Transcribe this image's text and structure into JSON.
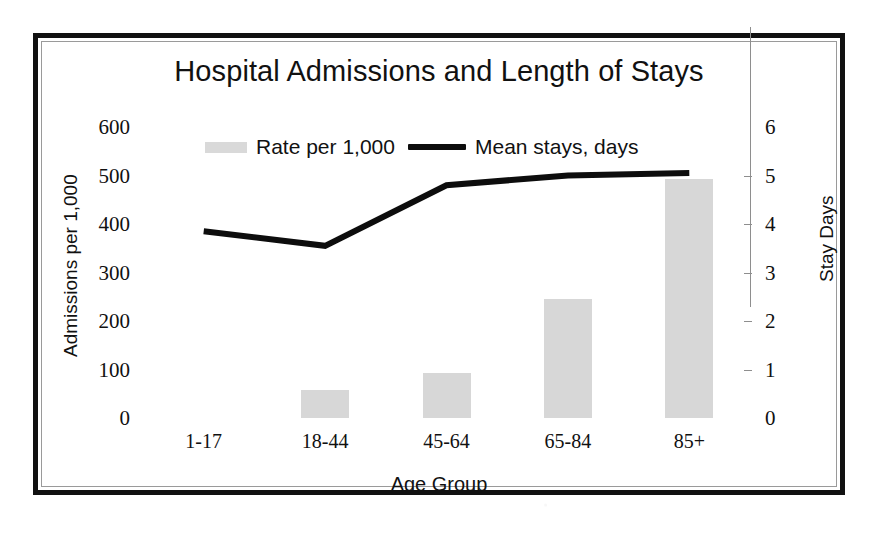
{
  "chart_data": {
    "type": "bar",
    "title": "Hospital Admissions and Length of Stays",
    "xlabel": "Age Group",
    "ylabel": "Admissions per 1,000",
    "y2label": "Stay Days",
    "categories": [
      "1-17",
      "18-44",
      "45-64",
      "65-84",
      "85+"
    ],
    "yticks": [
      "600",
      "500",
      "400",
      "300",
      "200",
      "100",
      "0"
    ],
    "ytick_values": [
      600,
      500,
      400,
      300,
      200,
      100,
      0
    ],
    "ylim": [
      0,
      600
    ],
    "y2ticks": [
      "6",
      "5",
      "4",
      "3",
      "2",
      "1",
      "0"
    ],
    "y2tick_values": [
      6,
      5,
      4,
      3,
      2,
      1,
      0
    ],
    "y2lim": [
      0,
      6
    ],
    "grid": false,
    "legend_position": "top-center",
    "series": [
      {
        "name": "Rate per 1,000",
        "type": "bar",
        "axis": "left",
        "color": "#d7d7d7",
        "values": [
          0,
          58,
          93,
          245,
          492
        ]
      },
      {
        "name": "Mean stays, days",
        "type": "line",
        "axis": "right",
        "color": "#0d0d0d",
        "values": [
          3.85,
          3.55,
          4.8,
          5.0,
          5.05
        ]
      }
    ]
  },
  "legend": {
    "bar_label": "Rate per 1,000",
    "line_label": "Mean stays, days"
  }
}
